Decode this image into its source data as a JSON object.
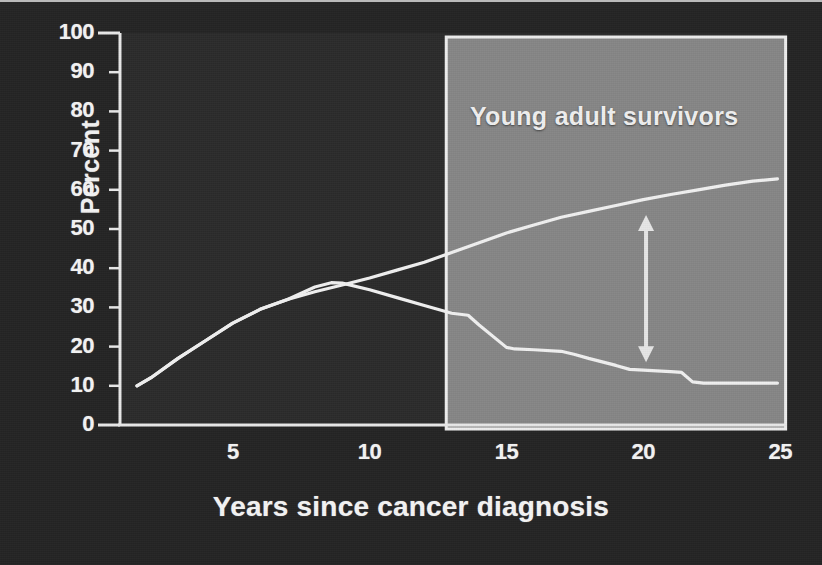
{
  "chart_data": {
    "type": "line",
    "title": "",
    "xlabel": "Years since cancer diagnosis",
    "ylabel": "Percent",
    "xlim": [
      0,
      25
    ],
    "ylim": [
      0,
      100
    ],
    "grid": false,
    "legend_position": "none",
    "x_ticks": [
      "5",
      "10",
      "15",
      "20",
      "25"
    ],
    "x_tick_values": [
      5,
      10,
      15,
      20,
      25
    ],
    "y_ticks": [
      "0",
      "10",
      "20",
      "30",
      "40",
      "50",
      "60",
      "70",
      "80",
      "90",
      "100"
    ],
    "y_tick_values": [
      0,
      10,
      20,
      30,
      40,
      50,
      60,
      70,
      80,
      90,
      100
    ],
    "annotations": [
      {
        "name": "shaded-region",
        "label": "Young adult survivors",
        "x_start": 12.8,
        "x_end": 25.2,
        "y_start": 0,
        "y_end": 100
      },
      {
        "name": "gap-arrow",
        "label": "",
        "x": 20.1,
        "y_top": 53.6,
        "y_bottom": 16.0
      }
    ],
    "series": [
      {
        "name": "rising-curve",
        "color": "#f0f0f0",
        "x": [
          1.5,
          2.0,
          3.0,
          4.0,
          5.0,
          6.0,
          7.0,
          8.0,
          9.0,
          10.0,
          11.0,
          12.0,
          13.0,
          14.0,
          15.0,
          16.0,
          17.0,
          18.0,
          19.0,
          20.0,
          21.0,
          22.0,
          23.0,
          24.0,
          24.9
        ],
        "y": [
          10.0,
          12.0,
          17.0,
          21.5,
          26.0,
          29.5,
          32.0,
          34.0,
          35.7,
          37.5,
          39.5,
          41.5,
          44.0,
          46.5,
          49.0,
          51.0,
          53.0,
          54.5,
          56.0,
          57.5,
          58.8,
          60.0,
          61.2,
          62.2,
          62.8
        ]
      },
      {
        "name": "falling-curve",
        "color": "#f0f0f0",
        "x": [
          1.5,
          2.0,
          3.0,
          4.0,
          5.0,
          6.0,
          7.0,
          8.0,
          8.6,
          9.0,
          10.0,
          11.0,
          12.0,
          13.0,
          13.6,
          14.0,
          15.0,
          15.3,
          16.0,
          17.0,
          17.5,
          18.0,
          19.0,
          19.5,
          20.0,
          21.0,
          21.4,
          21.8,
          22.2,
          23.0,
          24.0,
          24.9
        ],
        "y": [
          10.0,
          12.0,
          17.0,
          21.5,
          26.0,
          29.5,
          32.0,
          35.2,
          36.3,
          36.2,
          34.5,
          32.5,
          30.5,
          28.5,
          28.0,
          25.5,
          19.8,
          19.4,
          19.2,
          18.8,
          18.0,
          17.0,
          15.2,
          14.2,
          14.0,
          13.6,
          13.4,
          11.0,
          10.7,
          10.7,
          10.7,
          10.7
        ]
      }
    ],
    "colors": {
      "background": "#242424",
      "plot_background": "#2b2b2b",
      "shaded_region": "#8e8e8e",
      "axis": "#e8e8e8",
      "text": "#f4f4f4",
      "line": "#f0f0f0"
    }
  }
}
